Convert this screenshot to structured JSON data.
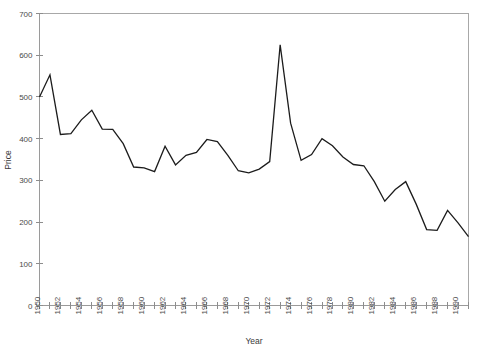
{
  "chart_data": {
    "type": "line",
    "title": "",
    "xlabel": "Year",
    "ylabel": "Price",
    "xlim": [
      1950,
      1991
    ],
    "ylim": [
      0,
      700
    ],
    "grid": false,
    "legend": null,
    "y_ticks": [
      0,
      100,
      200,
      300,
      400,
      500,
      600,
      700
    ],
    "y_tick_labels": [
      "0",
      "100",
      "200",
      "300",
      "400",
      "500",
      "600",
      "700"
    ],
    "x_ticks": [
      1950,
      1952,
      1954,
      1956,
      1958,
      1960,
      1962,
      1964,
      1966,
      1968,
      1970,
      1972,
      1974,
      1976,
      1978,
      1980,
      1982,
      1984,
      1986,
      1988,
      1990
    ],
    "x_tick_labels": [
      "1950",
      "1952",
      "1954",
      "1956",
      "1958",
      "1960",
      "1962",
      "1964",
      "1966",
      "1968",
      "1970",
      "1972",
      "1974",
      "1976",
      "1978",
      "1980",
      "1982",
      "1984",
      "1986",
      "1988",
      "1990"
    ],
    "x_minor_ticks_every": 1,
    "line_color": "#1c1c1c",
    "x": [
      1950,
      1951,
      1952,
      1953,
      1954,
      1955,
      1956,
      1957,
      1958,
      1959,
      1960,
      1961,
      1962,
      1963,
      1964,
      1965,
      1966,
      1967,
      1968,
      1969,
      1970,
      1971,
      1972,
      1973,
      1974,
      1975,
      1976,
      1977,
      1978,
      1979,
      1980,
      1981,
      1982,
      1983,
      1984,
      1985,
      1986,
      1987,
      1988,
      1989,
      1990,
      1991
    ],
    "y": [
      500,
      553,
      410,
      412,
      445,
      468,
      423,
      422,
      388,
      332,
      330,
      321,
      382,
      337,
      360,
      367,
      398,
      393,
      360,
      323,
      318,
      327,
      345,
      625,
      437,
      348,
      362,
      400,
      383,
      356,
      338,
      335,
      297,
      250,
      278,
      297,
      243,
      182,
      180,
      228,
      198,
      165
    ],
    "values": [
      500,
      553,
      410,
      412,
      445,
      468,
      423,
      422,
      388,
      332,
      330,
      321,
      382,
      337,
      360,
      367,
      398,
      393,
      360,
      323,
      318,
      327,
      345,
      625,
      437,
      348,
      362,
      400,
      383,
      356,
      338,
      335,
      297,
      250,
      278,
      297,
      243,
      182,
      180,
      228,
      198,
      165
    ],
    "series": [
      {
        "name": "Price",
        "values": [
          500,
          553,
          410,
          412,
          445,
          468,
          423,
          422,
          388,
          332,
          330,
          321,
          382,
          337,
          360,
          367,
          398,
          393,
          360,
          323,
          318,
          327,
          345,
          625,
          437,
          348,
          362,
          400,
          383,
          356,
          338,
          335,
          297,
          250,
          278,
          297,
          243,
          182,
          180,
          228,
          198,
          165
        ]
      }
    ],
    "annotations": []
  }
}
